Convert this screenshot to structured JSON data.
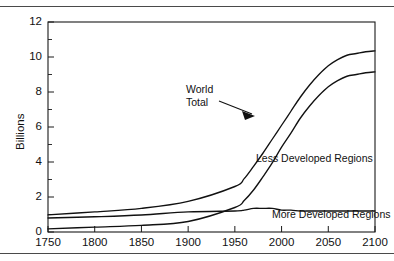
{
  "figure": {
    "name": "world-population-projection-chart",
    "rules": {
      "top": "divider",
      "bottom": "divider"
    }
  },
  "chart_data": {
    "type": "line",
    "title": "",
    "xlabel": "",
    "ylabel": "Billions",
    "xlim": [
      1750,
      2100
    ],
    "ylim": [
      0,
      12
    ],
    "grid": false,
    "legend": "inline-annotations",
    "xticks": [
      "1750",
      "1800",
      "1850",
      "1900",
      "1950",
      "2000",
      "2050",
      "2100"
    ],
    "yticks": [
      "0",
      "2",
      "4",
      "6",
      "8",
      "10",
      "12"
    ],
    "yminorticks": [
      1,
      3,
      5,
      7,
      9,
      11
    ],
    "x": [
      1750,
      1800,
      1850,
      1900,
      1950,
      1960,
      1970,
      1980,
      1990,
      2000,
      2010,
      2020,
      2030,
      2040,
      2050,
      2060,
      2070,
      2080,
      2090,
      2100
    ],
    "series": [
      {
        "name": "World Total",
        "label": "World Total",
        "values": [
          0.98,
          1.15,
          1.35,
          1.75,
          2.6,
          3.05,
          3.75,
          4.5,
          5.3,
          6.1,
          6.9,
          7.7,
          8.4,
          9.0,
          9.5,
          9.85,
          10.1,
          10.2,
          10.3,
          10.35
        ]
      },
      {
        "name": "Less Developed Regions",
        "label": "Less Developed Regions",
        "values": [
          0.18,
          0.28,
          0.38,
          0.6,
          1.4,
          1.8,
          2.4,
          3.15,
          3.95,
          4.85,
          5.65,
          6.5,
          7.2,
          7.8,
          8.3,
          8.65,
          8.9,
          9.0,
          9.1,
          9.15
        ]
      },
      {
        "name": "More Developed Regions",
        "label": "More Developed Regions",
        "values": [
          0.8,
          0.87,
          0.97,
          1.15,
          1.2,
          1.25,
          1.35,
          1.35,
          1.35,
          1.25,
          1.25,
          1.2,
          1.2,
          1.2,
          1.2,
          1.2,
          1.2,
          1.2,
          1.2,
          1.2
        ]
      }
    ],
    "annotations": [
      {
        "name": "world-total",
        "text_line1": "World",
        "text_line2": "Total",
        "arrow": true
      },
      {
        "name": "less-developed-regions",
        "text": "Less Developed Regions",
        "arrow": false
      },
      {
        "name": "more-developed-regions",
        "text": "More Developed Regions",
        "arrow": false
      }
    ],
    "colors": {
      "line": "#111111",
      "axis": "#1a1a1a",
      "background": "#ffffff"
    }
  }
}
